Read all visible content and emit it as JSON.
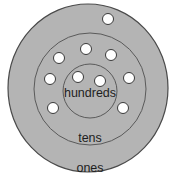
{
  "diagram": {
    "type": "place-value-concentric-circles",
    "colors": {
      "fill": "#b4b4b4",
      "stroke": "#4a4a4a",
      "dot_fill": "#ffffff",
      "dot_stroke": "#3a3a3a",
      "text": "#1e1e1e"
    },
    "rings": [
      {
        "name": "ones",
        "label": "ones"
      },
      {
        "name": "tens",
        "label": "tens"
      },
      {
        "name": "hundreds",
        "label": "hundreds"
      }
    ],
    "counts": {
      "ones": 1,
      "tens": 7,
      "hundreds": 2
    }
  }
}
